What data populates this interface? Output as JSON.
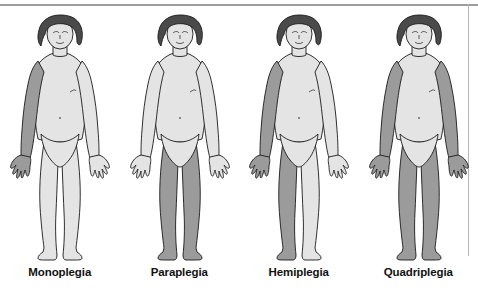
{
  "diagram": {
    "colors": {
      "affected_limb": "#9b9b9b",
      "unaffected_skin": "#e4e4e4",
      "hair": "#4a4a4a",
      "outline": "#1a1a1a",
      "background": "#ffffff",
      "frame_rule": "#9d9d9d",
      "label_text": "#111111"
    },
    "panels": [
      {
        "label": "Monoplegia",
        "affected_regions": [
          "right-arm"
        ],
        "affected_limb_count": 1,
        "description": "Paralysis of one limb — a single arm is shaded"
      },
      {
        "label": "Paraplegia",
        "affected_regions": [
          "right-leg",
          "left-leg"
        ],
        "affected_limb_count": 2,
        "description": "Paralysis of both legs below the hips"
      },
      {
        "label": "Hemiplegia",
        "affected_regions": [
          "right-arm",
          "right-leg"
        ],
        "affected_limb_count": 2,
        "description": "Paralysis of the arm and leg on one side of the body"
      },
      {
        "label": "Quadriplegia",
        "affected_regions": [
          "right-arm",
          "left-arm",
          "right-leg",
          "left-leg"
        ],
        "affected_limb_count": 4,
        "description": "Paralysis of all four limbs"
      }
    ]
  }
}
